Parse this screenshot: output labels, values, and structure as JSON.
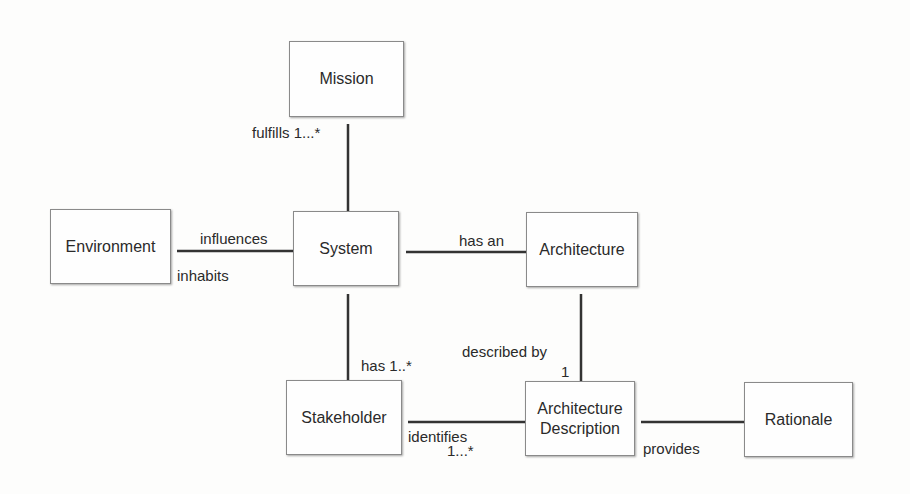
{
  "diagram": {
    "nodes": {
      "mission": {
        "label": "Mission"
      },
      "environment": {
        "label": "Environment"
      },
      "system": {
        "label": "System"
      },
      "architecture": {
        "label": "Architecture"
      },
      "stakeholder": {
        "label": "Stakeholder"
      },
      "architecture_description": {
        "label_line1": "Architecture",
        "label_line2": "Description"
      },
      "rationale": {
        "label": "Rationale"
      }
    },
    "edges": {
      "system_mission": {
        "label": "fulfills 1...*"
      },
      "environment_system": {
        "label_top": "influences",
        "label_bottom": "inhabits"
      },
      "system_architecture": {
        "label": "has an"
      },
      "system_stakeholder": {
        "label": "has 1..*"
      },
      "architecture_description": {
        "label": "described by",
        "multiplicity": "1"
      },
      "stakeholder_description": {
        "label": "identifies",
        "multiplicity": "1...*"
      },
      "description_rationale": {
        "label": "provides"
      }
    }
  }
}
